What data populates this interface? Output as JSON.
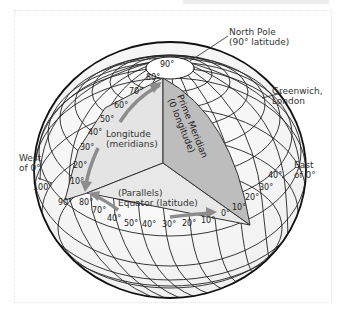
{
  "diagram": {
    "labels": {
      "north_pole": [
        "North Pole",
        "(90° latitude)"
      ],
      "greenwich": [
        "Greenwich,",
        "London"
      ],
      "west": [
        "West",
        "of 0°"
      ],
      "east": [
        "East",
        "of 0°"
      ],
      "longitude": [
        "Longitude",
        "(meridians)"
      ],
      "prime_meridian": [
        "Prime Meridian",
        "(0 longitude)"
      ],
      "parallels": "(Parallels)",
      "equator": "Equator (latitude)"
    },
    "latitude_ticks": [
      "90°",
      "80°",
      "70°",
      "60°",
      "50°",
      "40°",
      "30°",
      "20°",
      "10°"
    ],
    "west_longitude_ticks": [
      "100°",
      "90°",
      "80°",
      "70°",
      "40°",
      "50°",
      "40°",
      "30°",
      "20°",
      "10°",
      "0°"
    ],
    "east_longitude_ticks": [
      "10°",
      "20°",
      "30°",
      "40°"
    ],
    "colors": {
      "globe_line": "#222222",
      "shade_light": "#e4e4e4",
      "shade_dark": "#bdbdbd",
      "arrow": "#8c8c8c"
    }
  }
}
